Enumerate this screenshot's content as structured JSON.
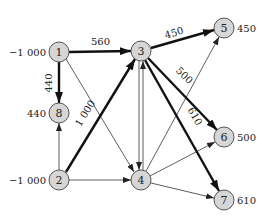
{
  "diagram": {
    "type": "network-flow",
    "nodes": [
      {
        "id": "1",
        "label": "1",
        "x": 59,
        "y": 52,
        "value": "−1 000",
        "value_side": "left"
      },
      {
        "id": "2",
        "label": "2",
        "x": 59,
        "y": 180,
        "value": "−1 000",
        "value_side": "left"
      },
      {
        "id": "3",
        "label": "3",
        "x": 141,
        "y": 51,
        "value": "",
        "value_side": "none"
      },
      {
        "id": "4",
        "label": "4",
        "x": 141,
        "y": 180,
        "value": "",
        "value_side": "none"
      },
      {
        "id": "5",
        "label": "5",
        "x": 224,
        "y": 28,
        "value": "450",
        "value_side": "right"
      },
      {
        "id": "6",
        "label": "6",
        "x": 224,
        "y": 137,
        "value": "500",
        "value_side": "right"
      },
      {
        "id": "7",
        "label": "7",
        "x": 224,
        "y": 200,
        "value": "610",
        "value_side": "right"
      },
      {
        "id": "8",
        "label": "8",
        "x": 59,
        "y": 113,
        "value": "440",
        "value_side": "left"
      }
    ],
    "edges": [
      {
        "from": "1",
        "to": "3",
        "flow": "560",
        "thick": true
      },
      {
        "from": "1",
        "to": "8",
        "flow": "440",
        "thick": true
      },
      {
        "from": "2",
        "to": "3",
        "flow": "1 000",
        "thick": true
      },
      {
        "from": "3",
        "to": "5",
        "flow": "450",
        "thick": true
      },
      {
        "from": "3",
        "to": "6",
        "flow": "500",
        "thick": true
      },
      {
        "from": "3",
        "to": "7",
        "flow": "610",
        "thick": true
      },
      {
        "from": "1",
        "to": "4",
        "flow": "",
        "thick": false
      },
      {
        "from": "2",
        "to": "8",
        "flow": "",
        "thick": false
      },
      {
        "from": "2",
        "to": "4",
        "flow": "",
        "thick": false
      },
      {
        "from": "3",
        "to": "4",
        "flow": "",
        "thick": false
      },
      {
        "from": "4",
        "to": "3",
        "flow": "",
        "thick": false
      },
      {
        "from": "4",
        "to": "5",
        "flow": "",
        "thick": false
      },
      {
        "from": "4",
        "to": "6",
        "flow": "",
        "thick": false
      },
      {
        "from": "4",
        "to": "7",
        "flow": "",
        "thick": false
      }
    ]
  },
  "labels": {
    "node1": "1",
    "node2": "2",
    "node3": "3",
    "node4": "4",
    "node5": "5",
    "node6": "6",
    "node7": "7",
    "node8": "8",
    "supply1": "−1 000",
    "supply2": "−1 000",
    "demand5": "450",
    "demand6": "500",
    "demand7": "610",
    "demand8": "440",
    "flow13": "560",
    "flow18": "440",
    "flow23": "1 000",
    "flow35": "450",
    "flow36": "500",
    "flow37": "610"
  },
  "colors": {
    "node_fill": "#d6d6d6",
    "node_stroke": "#555555",
    "edge": "#111111",
    "background": "#ffffff"
  }
}
